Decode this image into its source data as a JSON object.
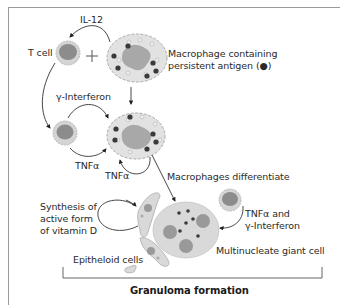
{
  "diagram": {
    "title": "Granuloma formation",
    "labels": {
      "il12": "IL-12",
      "t_cell": "T cell",
      "plus": "+",
      "macrophage_line1": "Macrophage containing",
      "macrophage_line2": "persistent antigen (●)",
      "gamma_interferon": "γ-Interferon",
      "tnf_a_left": "TNFα",
      "tnf_a_loop": "TNFα",
      "macrophages_differentiate": "Macrophages differentiate",
      "synthesis_line1": "Synthesis of",
      "synthesis_line2": "active form",
      "synthesis_line3": "of vitamin D",
      "tnf_and_line1": "TNFα and",
      "tnf_and_line2": "γ-Interferon",
      "epitheloid_cells": "Epitheloid cells",
      "giant_cell": "Multinucleate giant cell"
    },
    "colors": {
      "cell_fill": "#d9d9d9",
      "nucleus": "#9a9a9a",
      "antigen": "#3a3a3a",
      "line": "#333333",
      "frame": "#9a9a9a"
    }
  }
}
